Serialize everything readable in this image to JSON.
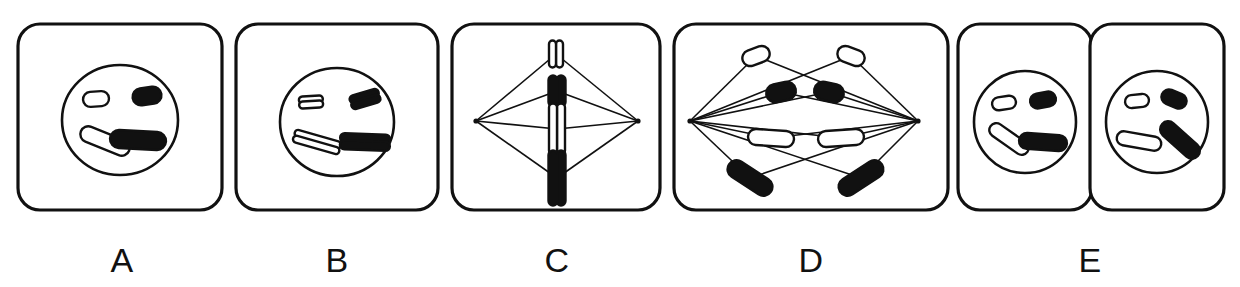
{
  "figure": {
    "background_color": "#ffffff",
    "ink_color": "#111111",
    "width": 1240,
    "height": 287
  },
  "panels": [
    {
      "id": "A",
      "label": "A",
      "stage_name": "interphase",
      "description": "Cell with intact nucleus containing four unreplicated chromosomes",
      "label_x": 122,
      "label_y": 272,
      "cell": {
        "x": 18,
        "y": 24,
        "width": 204,
        "height": 186,
        "radius": 22
      },
      "nucleus": {
        "cx": 120,
        "cy": 120,
        "rx": 58,
        "ry": 55
      },
      "spindle": null,
      "chromosomes": [
        {
          "name": "short-light-chromosome",
          "shade": "light",
          "cx": 96,
          "cy": 99,
          "length": 26,
          "thickness": 15,
          "angle": -4,
          "chromatids": 1
        },
        {
          "name": "short-dark-chromosome",
          "shade": "dark",
          "cx": 147,
          "cy": 96,
          "length": 29,
          "thickness": 17,
          "angle": -8,
          "chromatids": 1
        },
        {
          "name": "long-light-chromosome",
          "shade": "light",
          "cx": 105,
          "cy": 141,
          "length": 52,
          "thickness": 16,
          "angle": 22,
          "chromatids": 1
        },
        {
          "name": "long-dark-chromosome",
          "shade": "dark",
          "cx": 138,
          "cy": 140,
          "length": 56,
          "thickness": 18,
          "angle": 3,
          "chromatids": 1
        }
      ]
    },
    {
      "id": "B",
      "label": "B",
      "stage_name": "prophase",
      "description": "Nucleus with four replicated chromosomes, each made of two sister chromatids",
      "label_x": 337,
      "label_y": 272,
      "cell": {
        "x": 236,
        "y": 24,
        "width": 202,
        "height": 186,
        "radius": 22
      },
      "nucleus": {
        "cx": 337,
        "cy": 122,
        "rx": 57,
        "ry": 54
      },
      "spindle": null,
      "chromosomes": [
        {
          "name": "short-light-chromosome-pair",
          "shade": "light",
          "cx": 311,
          "cy": 102,
          "length": 24,
          "thickness": 7,
          "angle": -3,
          "chromatids": 2,
          "gap": 5
        },
        {
          "name": "short-dark-chromosome-pair",
          "shade": "dark",
          "cx": 365,
          "cy": 99,
          "length": 30,
          "thickness": 8,
          "angle": -16,
          "chromatids": 2,
          "gap": 6
        },
        {
          "name": "long-light-chromosome-pair",
          "shade": "light",
          "cx": 317,
          "cy": 142,
          "length": 48,
          "thickness": 7,
          "angle": 16,
          "chromatids": 2,
          "gap": 6
        },
        {
          "name": "long-dark-chromosome-pair",
          "shade": "dark",
          "cx": 365,
          "cy": 142,
          "length": 50,
          "thickness": 9,
          "angle": 2,
          "chromatids": 2,
          "gap": 7
        }
      ]
    },
    {
      "id": "C",
      "label": "C",
      "stage_name": "metaphase",
      "description": "Chromosomes aligned at the cell equator with spindle fibers attached to two poles",
      "label_x": 557,
      "label_y": 272,
      "cell": {
        "x": 452,
        "y": 24,
        "width": 208,
        "height": 186,
        "radius": 22
      },
      "nucleus": null,
      "spindle": {
        "left_pole": {
          "x": 476,
          "y": 121
        },
        "right_pole": {
          "x": 638,
          "y": 121
        }
      },
      "chromosomes": [
        {
          "name": "short-light-chromosome-pair",
          "shade": "light",
          "cx": 556,
          "cy": 54,
          "length": 27,
          "thickness": 7,
          "angle": 90,
          "chromatids": 2,
          "gap": 7
        },
        {
          "name": "short-dark-chromosome-pair",
          "shade": "dark",
          "cx": 557,
          "cy": 91,
          "length": 31,
          "thickness": 9,
          "angle": 90,
          "chromatids": 2,
          "gap": 8
        },
        {
          "name": "long-light-chromosome-pair",
          "shade": "light",
          "cx": 557,
          "cy": 129,
          "length": 51,
          "thickness": 8,
          "angle": 90,
          "chromatids": 2,
          "gap": 8
        },
        {
          "name": "long-dark-chromosome-pair",
          "shade": "dark",
          "cx": 557,
          "cy": 178,
          "length": 55,
          "thickness": 9,
          "angle": 90,
          "chromatids": 2,
          "gap": 8
        }
      ]
    },
    {
      "id": "D",
      "label": "D",
      "stage_name": "anaphase",
      "description": "Sister chromatids separating and moving toward opposite spindle poles",
      "label_x": 811,
      "label_y": 272,
      "cell": {
        "x": 674,
        "y": 24,
        "width": 274,
        "height": 186,
        "radius": 22
      },
      "nucleus": null,
      "spindle": {
        "left_pole": {
          "x": 690,
          "y": 121
        },
        "right_pole": {
          "x": 918,
          "y": 121
        }
      },
      "chromosomes": [
        {
          "name": "short-light-chromatid-left",
          "shade": "light",
          "cx": 756,
          "cy": 56,
          "length": 28,
          "thickness": 16,
          "angle": -20,
          "chromatids": 1
        },
        {
          "name": "short-dark-chromatid-left",
          "shade": "dark",
          "cx": 781,
          "cy": 92,
          "length": 30,
          "thickness": 18,
          "angle": -12,
          "chromatids": 1
        },
        {
          "name": "long-light-chromatid-left",
          "shade": "light",
          "cx": 771,
          "cy": 138,
          "length": 46,
          "thickness": 16,
          "angle": 4,
          "chromatids": 1
        },
        {
          "name": "long-dark-chromatid-left",
          "shade": "dark",
          "cx": 750,
          "cy": 178,
          "length": 50,
          "thickness": 18,
          "angle": 33,
          "chromatids": 1
        },
        {
          "name": "short-light-chromatid-right",
          "shade": "light",
          "cx": 851,
          "cy": 56,
          "length": 28,
          "thickness": 16,
          "angle": 20,
          "chromatids": 1
        },
        {
          "name": "short-dark-chromatid-right",
          "shade": "dark",
          "cx": 829,
          "cy": 92,
          "length": 30,
          "thickness": 18,
          "angle": 12,
          "chromatids": 1
        },
        {
          "name": "long-light-chromatid-right",
          "shade": "light",
          "cx": 841,
          "cy": 138,
          "length": 46,
          "thickness": 16,
          "angle": -4,
          "chromatids": 1
        },
        {
          "name": "long-dark-chromatid-right",
          "shade": "dark",
          "cx": 861,
          "cy": 178,
          "length": 50,
          "thickness": 18,
          "angle": -33,
          "chromatids": 1
        }
      ]
    },
    {
      "id": "E",
      "label": "E",
      "stage_name": "telophase-cytokinesis",
      "description": "Two daughter cells, each with a reformed nucleus containing four chromosomes",
      "label_x": 1090,
      "label_y": 272,
      "cell": {
        "x": 958,
        "y": 24,
        "width": 134,
        "height": 186,
        "radius": 22
      },
      "second_cell": {
        "x": 1090,
        "y": 24,
        "width": 134,
        "height": 186,
        "radius": 22
      },
      "nucleus": {
        "cx": 1025,
        "cy": 122,
        "rx": 51,
        "ry": 51
      },
      "second_nucleus": {
        "cx": 1157,
        "cy": 122,
        "rx": 51,
        "ry": 51
      },
      "spindle": null,
      "chromosomes": [
        {
          "name": "short-light-chromosome-daughter-left",
          "shade": "light",
          "cx": 1004,
          "cy": 103,
          "length": 24,
          "thickness": 13,
          "angle": -8,
          "chromatids": 1
        },
        {
          "name": "short-dark-chromosome-daughter-left",
          "shade": "dark",
          "cx": 1043,
          "cy": 100,
          "length": 26,
          "thickness": 15,
          "angle": -10,
          "chromatids": 1
        },
        {
          "name": "long-light-chromosome-daughter-left",
          "shade": "light",
          "cx": 1009,
          "cy": 139,
          "length": 45,
          "thickness": 14,
          "angle": 35,
          "chromatids": 1
        },
        {
          "name": "long-dark-chromosome-daughter-left",
          "shade": "dark",
          "cx": 1043,
          "cy": 142,
          "length": 48,
          "thickness": 16,
          "angle": 4,
          "chromatids": 1
        },
        {
          "name": "short-light-chromosome-daughter-right",
          "shade": "light",
          "cx": 1137,
          "cy": 101,
          "length": 24,
          "thickness": 13,
          "angle": -6,
          "chromatids": 1
        },
        {
          "name": "short-dark-chromosome-daughter-right",
          "shade": "dark",
          "cx": 1174,
          "cy": 99,
          "length": 26,
          "thickness": 15,
          "angle": 22,
          "chromatids": 1
        },
        {
          "name": "long-light-chromosome-daughter-right",
          "shade": "light",
          "cx": 1139,
          "cy": 141,
          "length": 45,
          "thickness": 14,
          "angle": 10,
          "chromatids": 1
        },
        {
          "name": "long-dark-chromosome-daughter-right",
          "shade": "dark",
          "cx": 1180,
          "cy": 140,
          "length": 48,
          "thickness": 16,
          "angle": 42,
          "chromatids": 1
        }
      ]
    }
  ]
}
